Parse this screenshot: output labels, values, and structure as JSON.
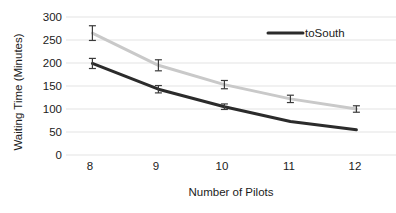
{
  "chart_data": {
    "type": "line",
    "title": "",
    "xlabel": "Number of Pilots",
    "ylabel": "Waiting Time (Minutes)",
    "x": [
      8,
      9,
      10,
      11,
      12
    ],
    "xticklabels": [
      "8",
      "9",
      "10",
      "11",
      "12"
    ],
    "yticklabels": [
      "0",
      "50",
      "100",
      "150",
      "200",
      "250",
      "300"
    ],
    "yticks": [
      0,
      50,
      100,
      150,
      200,
      250,
      300
    ],
    "ylim": [
      0,
      300
    ],
    "xlim": [
      7.6,
      12.6
    ],
    "grid": "horizontal",
    "legend_position": "top-right",
    "series": [
      {
        "name": "light-series",
        "legend_label": "",
        "color": "#c9c9c9",
        "values": [
          265,
          195,
          153,
          122,
          100
        ],
        "errors": [
          16,
          12,
          9,
          8,
          7
        ]
      },
      {
        "name": "toSouth",
        "legend_label": "toSouth",
        "color": "#2b2b2b",
        "values": [
          199,
          143,
          105,
          73,
          55
        ],
        "errors": [
          11,
          8,
          6,
          0,
          0
        ]
      }
    ],
    "legend": [
      {
        "label": "toSouth",
        "color": "#2b2b2b"
      }
    ]
  },
  "colors": {
    "grid": "#e3e3e3",
    "text": "#1b1b1b",
    "background": "#ffffff",
    "series_light": "#c9c9c9",
    "series_dark": "#2b2b2b"
  }
}
